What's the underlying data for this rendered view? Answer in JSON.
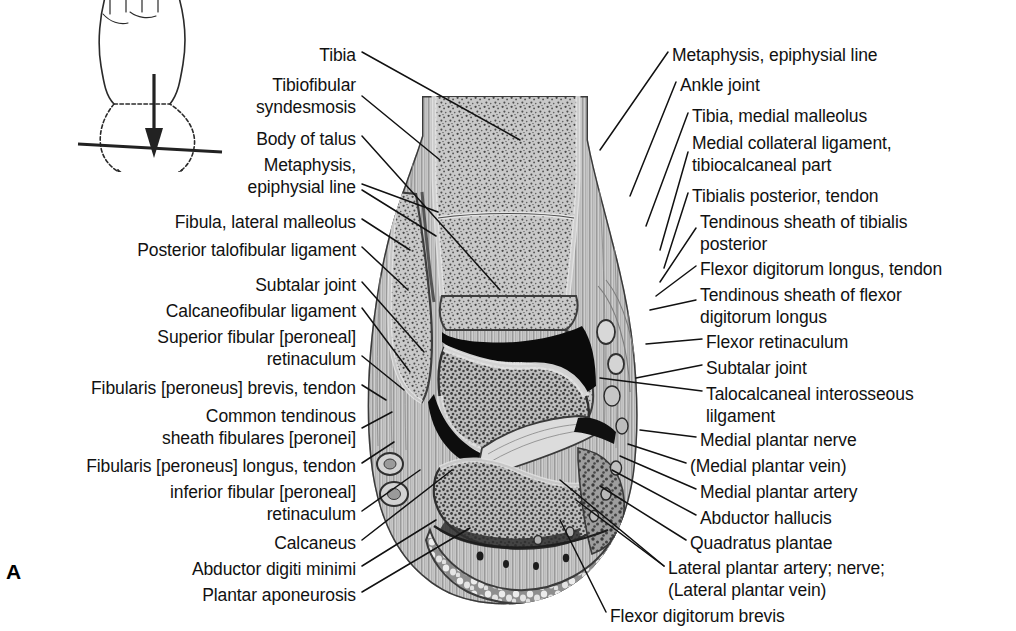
{
  "plate": {
    "letter": "A",
    "figure_name": "coronal-section-of-ankle-and-foot",
    "background_color": "#ffffff",
    "ink_color": "#111111"
  },
  "orientation_diagram": {
    "name": "foot-dorsal-view-section-plane",
    "description": "dorsal view of foot with horizontal section plane line and downward viewing arrow"
  },
  "labels_left": [
    {
      "text": "Tibia",
      "x": 356,
      "y": 45,
      "lines": 1
    },
    {
      "text": "Tibiofibular\nsyndesmosis",
      "x": 356,
      "y": 75,
      "lines": 2
    },
    {
      "text": "Body of talus",
      "x": 356,
      "y": 129,
      "lines": 1
    },
    {
      "text": "Metaphysis,\nepiphysial line",
      "x": 356,
      "y": 155,
      "lines": 2
    },
    {
      "text": "Fibula, lateral malleolus",
      "x": 356,
      "y": 212,
      "lines": 1
    },
    {
      "text": "Posterior talofibular ligament",
      "x": 356,
      "y": 240,
      "lines": 1
    },
    {
      "text": "Subtalar joint",
      "x": 356,
      "y": 275,
      "lines": 1
    },
    {
      "text": "Calcaneofibular ligament",
      "x": 356,
      "y": 301,
      "lines": 1
    },
    {
      "text": "Superior fibular [peroneal]\nretinaculum",
      "x": 356,
      "y": 327,
      "lines": 2
    },
    {
      "text": "Fibularis [peroneus] brevis, tendon",
      "x": 356,
      "y": 378,
      "lines": 1
    },
    {
      "text": "Common tendinous\nsheath fibulares [peronei]",
      "x": 356,
      "y": 406,
      "lines": 2
    },
    {
      "text": "Fibularis [peroneus] longus, tendon",
      "x": 356,
      "y": 456,
      "lines": 1
    },
    {
      "text": "inferior fibular [peroneal]\nretinaculum",
      "x": 356,
      "y": 482,
      "lines": 2
    },
    {
      "text": "Calcaneus",
      "x": 356,
      "y": 533,
      "lines": 1
    },
    {
      "text": "Abductor digiti minimi",
      "x": 356,
      "y": 559,
      "lines": 1
    },
    {
      "text": "Plantar aponeurosis",
      "x": 356,
      "y": 585,
      "lines": 1
    }
  ],
  "labels_right": [
    {
      "text": "Metaphysis, epiphysial line",
      "x": 672,
      "y": 45,
      "lines": 1
    },
    {
      "text": "Ankle joint",
      "x": 680,
      "y": 75,
      "lines": 1
    },
    {
      "text": "Tibia, medial malleolus",
      "x": 692,
      "y": 106,
      "lines": 1
    },
    {
      "text": "Medial collateral ligament,\ntibiocalcaneal part",
      "x": 692,
      "y": 133,
      "lines": 2
    },
    {
      "text": "Tibialis posterior, tendon",
      "x": 692,
      "y": 186,
      "lines": 1
    },
    {
      "text": "Tendinous sheath of tibialis\nposterior",
      "x": 700,
      "y": 212,
      "lines": 2
    },
    {
      "text": "Flexor digitorum longus, tendon",
      "x": 700,
      "y": 259,
      "lines": 1
    },
    {
      "text": "Tendinous sheath of flexor\ndigitorum longus",
      "x": 700,
      "y": 285,
      "lines": 2
    },
    {
      "text": "Flexor retinaculum",
      "x": 706,
      "y": 332,
      "lines": 1
    },
    {
      "text": "Subtalar joint",
      "x": 706,
      "y": 358,
      "lines": 1
    },
    {
      "text": "Talocalcaneal interosseous\nlilgament",
      "x": 706,
      "y": 384,
      "lines": 2
    },
    {
      "text": "Medial plantar nerve",
      "x": 700,
      "y": 430,
      "lines": 1
    },
    {
      "text": "(Medial plantar vein)",
      "x": 690,
      "y": 456,
      "lines": 1
    },
    {
      "text": "Medial plantar artery",
      "x": 700,
      "y": 482,
      "lines": 1
    },
    {
      "text": "Abductor hallucis",
      "x": 700,
      "y": 508,
      "lines": 1
    },
    {
      "text": "Quadratus plantae",
      "x": 690,
      "y": 533,
      "lines": 1
    },
    {
      "text": "Lateral plantar artery; nerve;\n(Lateral plantar vein)",
      "x": 668,
      "y": 558,
      "lines": 2
    },
    {
      "text": "Flexor digitorum brevis",
      "x": 610,
      "y": 606,
      "lines": 1
    }
  ]
}
